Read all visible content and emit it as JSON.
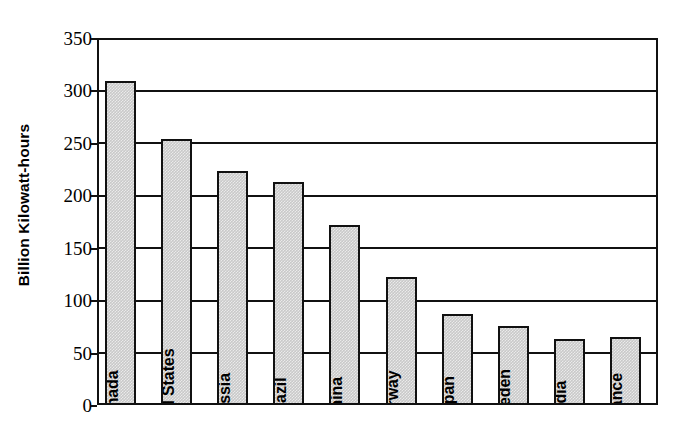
{
  "chart_data": {
    "type": "bar",
    "title": "",
    "xlabel": "",
    "ylabel": "Billion Kilowatt-hours",
    "ylim": [
      0,
      350
    ],
    "yticks": [
      0,
      50,
      100,
      150,
      200,
      250,
      300,
      350
    ],
    "ytick_labels": [
      "0",
      "50",
      "100",
      "150",
      "200",
      "250",
      "300",
      "350"
    ],
    "grid": true,
    "legend": null,
    "categories": [
      "Canada",
      "United States",
      "Russia",
      "Brazil",
      "China",
      "Norway",
      "Japan",
      "Sweden",
      "India",
      "France"
    ],
    "values": [
      309,
      254,
      223,
      213,
      172,
      122,
      87,
      75,
      63,
      65
    ],
    "bar_fill_color": "#c9c9c9",
    "bar_edge_color": "#111111",
    "axis_color": "#111111",
    "background_color": "#ffffff"
  }
}
